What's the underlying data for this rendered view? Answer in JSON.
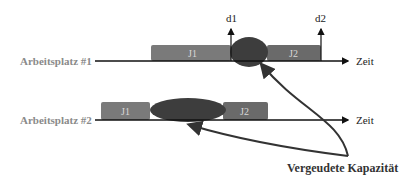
{
  "diagram": {
    "rows": [
      {
        "label": "Arbeitsplatz #1",
        "axis_label": "Zeit",
        "jobs": [
          {
            "label": "J1",
            "x": 151,
            "w": 80
          },
          {
            "label": "J2",
            "x": 267,
            "w": 54
          }
        ],
        "deadlines": [
          {
            "label": "d1",
            "x": 231
          },
          {
            "label": "d2",
            "x": 321
          }
        ]
      },
      {
        "label": "Arbeitsplatz #2",
        "axis_label": "Zeit",
        "jobs": [
          {
            "label": "J1",
            "x": 101,
            "w": 49
          },
          {
            "label": "J2",
            "x": 223,
            "w": 45
          }
        ]
      }
    ],
    "annotation": "Vergeudete Kapazität",
    "colors": {
      "job_fill": "#7a7a7a",
      "waste_fill": "#3d3d3d",
      "label_text": "#8a8a8a",
      "line": "#111111"
    }
  }
}
